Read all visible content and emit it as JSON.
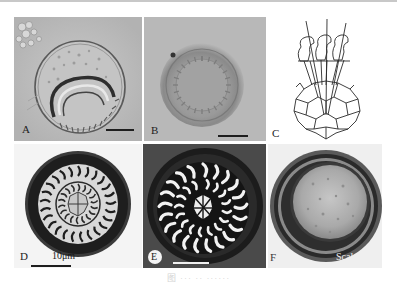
{
  "figure": {
    "panels": [
      {
        "id": "A",
        "label": "A",
        "type": "micrograph",
        "description": "light micrograph, spherical cyst with coiled ridged body"
      },
      {
        "id": "B",
        "label": "B",
        "type": "micrograph",
        "description": "light micrograph, round body with radial denticles"
      },
      {
        "id": "C",
        "label": "C",
        "type": "line-drawing",
        "description": "line drawing of denticles and central plates"
      },
      {
        "id": "D",
        "label": "D",
        "type": "micrograph",
        "description": "stained disc with dark rim and radial hooks",
        "scale_text": "10μm"
      },
      {
        "id": "E",
        "label": "E",
        "type": "micrograph",
        "description": "stained denticle ring, white hooks on dark background"
      },
      {
        "id": "F",
        "label": "F",
        "type": "micrograph",
        "description": "round body with thick dark rim and granular center",
        "scale_text": "Scale 1"
      }
    ],
    "caption": "图 ··· ·· ······"
  },
  "colors": {
    "micrograph_light": "#b9b9b9",
    "micrograph_mid": "#a5a5a5",
    "stain_dark": "#1c1c1c",
    "line_drawing": "#2a2a2a",
    "caption_text": "#d4d4d4",
    "top_rule": "#c8c8c8"
  }
}
